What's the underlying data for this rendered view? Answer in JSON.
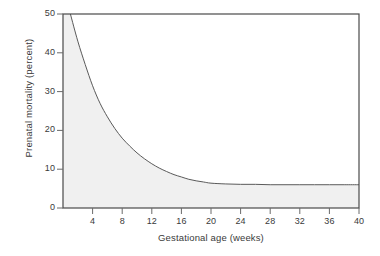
{
  "figure": {
    "background_color": "#ffffff",
    "axis_color": "#4a4a4a",
    "curve_color": "#555555",
    "fill_color": "#f0f0f0",
    "tick_color": "#6a6a6a"
  },
  "chart_data": {
    "type": "area",
    "title": "",
    "xlabel": "Gestational age (weeks)",
    "ylabel": "Prenatal mortality (percent)",
    "xlim": [
      0,
      40
    ],
    "ylim": [
      0,
      50
    ],
    "xticks": [
      4,
      8,
      12,
      16,
      20,
      24,
      28,
      32,
      36,
      40
    ],
    "xtick_labels": [
      "4",
      "8",
      "12",
      "16",
      "20",
      "24",
      "28",
      "32",
      "36",
      "40"
    ],
    "yticks": [
      0,
      10,
      20,
      30,
      40,
      50
    ],
    "ytick_labels": [
      "0",
      "10",
      "20",
      "30",
      "40",
      "50"
    ],
    "grid": false,
    "legend": null,
    "series": [
      {
        "name": "Prenatal mortality",
        "x": [
          1,
          2,
          3,
          4,
          5,
          6,
          7,
          8,
          9,
          10,
          11,
          12,
          13,
          14,
          15,
          16,
          17,
          18,
          19,
          20,
          22,
          24,
          26,
          28,
          30,
          32,
          34,
          36,
          38,
          40
        ],
        "values": [
          50.0,
          43.0,
          37.0,
          31.5,
          27.0,
          23.5,
          20.5,
          18.0,
          16.0,
          14.2,
          12.7,
          11.4,
          10.3,
          9.4,
          8.6,
          8.0,
          7.4,
          7.0,
          6.7,
          6.4,
          6.2,
          6.1,
          6.1,
          6.0,
          6.0,
          6.0,
          6.0,
          6.0,
          6.0,
          6.0
        ]
      }
    ],
    "annotations": [
      {
        "text": "asymptote approximately 6 percent beyond 20 weeks"
      }
    ]
  },
  "axis_labels": {
    "y_title": "Prenatal mortality (percent)",
    "x_title": "Gestational age (weeks)"
  }
}
